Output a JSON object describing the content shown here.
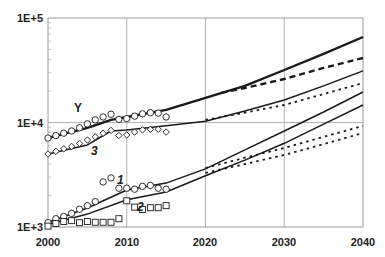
{
  "chart_data": {
    "type": "line",
    "title": "",
    "xlabel": "",
    "ylabel": "",
    "yscale": "log",
    "xlim": [
      2000,
      2040
    ],
    "ylim": [
      1000,
      100000
    ],
    "x_ticks": [
      2000,
      2010,
      2020,
      2030,
      2040
    ],
    "x_tick_labels": [
      "2000",
      "2010",
      "2020",
      "2030",
      "2040"
    ],
    "y_ticks": [
      1000,
      10000,
      100000
    ],
    "y_tick_labels": [
      "1E+3",
      "1E+4",
      "1E+5"
    ],
    "grid": true,
    "legend": null,
    "annotations": [
      "Y",
      "3",
      "1",
      "2"
    ],
    "series": [
      {
        "name": "Y",
        "label": "Y",
        "style": "solid-thick",
        "kind": "model",
        "x": [
          2000,
          2005,
          2008,
          2010,
          2015,
          2020,
          2025,
          2030,
          2035,
          2040
        ],
        "values": [
          7100,
          8900,
          10600,
          11300,
          13200,
          17200,
          22400,
          31800,
          45300,
          65800
        ]
      },
      {
        "name": "Y (alt. scenario)",
        "label": "",
        "style": "dashed-thick",
        "kind": "model",
        "x": [
          2022,
          2025,
          2030,
          2035,
          2040
        ],
        "values": [
          19200,
          21400,
          26100,
          33300,
          41400
        ]
      },
      {
        "name": "Y data",
        "label": "",
        "style": "circle-markers",
        "kind": "observed",
        "x": [
          2000,
          2001,
          2002,
          2003,
          2004,
          2005,
          2006,
          2007,
          2008,
          2009,
          2010,
          2011,
          2012,
          2013,
          2014,
          2015
        ],
        "values": [
          7100,
          7500,
          7900,
          8300,
          8900,
          9700,
          10600,
          11300,
          12000,
          10700,
          10900,
          11500,
          12100,
          12400,
          12300,
          11300
        ]
      },
      {
        "name": "3",
        "label": "3",
        "style": "solid",
        "kind": "model",
        "x": [
          2000,
          2005,
          2008,
          2010,
          2015,
          2020,
          2025,
          2030,
          2035,
          2040
        ],
        "values": [
          5000,
          6100,
          8300,
          8500,
          9300,
          10300,
          12900,
          16400,
          22400,
          31200
        ]
      },
      {
        "name": "3 (alt. scenario)",
        "label": "",
        "style": "dotted",
        "kind": "model",
        "x": [
          2020,
          2025,
          2030,
          2035,
          2040
        ],
        "values": [
          10600,
          12400,
          14700,
          18700,
          23900
        ]
      },
      {
        "name": "3 data",
        "label": "",
        "style": "diamond-markers",
        "kind": "observed",
        "x": [
          2000,
          2001,
          2002,
          2003,
          2004,
          2005,
          2006,
          2007,
          2008,
          2009,
          2010,
          2011,
          2012,
          2013,
          2014,
          2015
        ],
        "values": [
          5000,
          5300,
          5600,
          5900,
          6300,
          6800,
          7300,
          7900,
          8400,
          7500,
          7600,
          8100,
          8500,
          8600,
          8600,
          8100
        ]
      },
      {
        "name": "1",
        "label": "1",
        "style": "solid",
        "kind": "model",
        "x": [
          2000,
          2005,
          2010,
          2015,
          2020,
          2025,
          2030,
          2035,
          2040
        ],
        "values": [
          1110,
          1520,
          2260,
          2630,
          3600,
          5470,
          8300,
          12600,
          19600
        ]
      },
      {
        "name": "1 (alt. scenario)",
        "label": "",
        "style": "dotted",
        "kind": "model",
        "x": [
          2020,
          2025,
          2030,
          2035,
          2040
        ],
        "values": [
          3670,
          4600,
          5700,
          7300,
          9250
        ]
      },
      {
        "name": "1 data",
        "label": "",
        "style": "circle-markers",
        "kind": "observed",
        "x": [
          2000,
          2001,
          2002,
          2003,
          2004,
          2005,
          2006,
          2007,
          2008,
          2009,
          2010,
          2011,
          2012,
          2013,
          2014,
          2015
        ],
        "values": [
          1100,
          1200,
          1260,
          1350,
          1480,
          1600,
          1750,
          2700,
          2950,
          2350,
          2350,
          2300,
          2450,
          2500,
          2350,
          2300
        ]
      },
      {
        "name": "2",
        "label": "2",
        "style": "solid",
        "kind": "model",
        "x": [
          2000,
          2005,
          2010,
          2015,
          2020,
          2025,
          2030,
          2035,
          2040
        ],
        "values": [
          1060,
          1330,
          1820,
          2160,
          3090,
          4370,
          6330,
          9640,
          14700
        ]
      },
      {
        "name": "2 (alt. scenario)",
        "label": "",
        "style": "dotted",
        "kind": "model",
        "x": [
          2020,
          2025,
          2030,
          2035,
          2040
        ],
        "values": [
          3300,
          4000,
          4900,
          6200,
          7950
        ]
      },
      {
        "name": "2 data",
        "label": "",
        "style": "square-markers",
        "kind": "observed",
        "x": [
          2000,
          2001,
          2002,
          2003,
          2004,
          2005,
          2006,
          2007,
          2008,
          2009,
          2010,
          2011,
          2012,
          2013,
          2014,
          2015
        ],
        "values": [
          1020,
          1080,
          1130,
          1150,
          1100,
          1130,
          1110,
          1110,
          1110,
          1200,
          1780,
          1550,
          1470,
          1530,
          1530,
          1600
        ]
      }
    ]
  },
  "labels": {
    "y_top": "1E+5",
    "y_mid": "1E+4",
    "y_bottom": "1E+3",
    "x_2000": "2000",
    "x_2010": "2010",
    "x_2020": "2020",
    "x_2030": "2030",
    "x_2040": "2040",
    "curve_Y": "Y",
    "curve_3": "3",
    "curve_1": "1",
    "curve_2": "2"
  },
  "colors": {
    "line": "#1a1a1a",
    "grid": "#b4b4b4",
    "frame": "#9a9a9a",
    "background": "#ffffff"
  }
}
